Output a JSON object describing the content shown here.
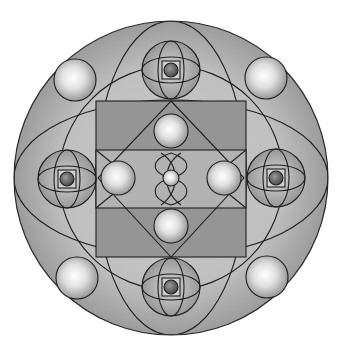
{
  "diagram": {
    "type": "sacred-geometry-mandala",
    "colors": {
      "background": "#ffffff",
      "outer_disc": "#a6a6a6",
      "inner_square": "#8e8e8e",
      "middle_band": "#a8a8a8",
      "line": "#1f1f1f",
      "orb_highlight": "#ffffff",
      "orb_shadow": "#8a8a8a"
    },
    "elements": {
      "outer_circle": {
        "cx": 171,
        "cy": 178,
        "r": 157
      },
      "square": {
        "x": 96,
        "y": 101,
        "w": 150,
        "h": 156
      },
      "diamond": {
        "top": [
          171,
          101
        ],
        "right": [
          244,
          178
        ],
        "bottom": [
          171,
          257
        ],
        "left": [
          98,
          178
        ]
      },
      "eye_orbs": [
        {
          "name": "top",
          "cx": 171,
          "cy": 70,
          "r": 29
        },
        {
          "name": "bottom",
          "cx": 171,
          "cy": 287,
          "r": 29
        },
        {
          "name": "left",
          "cx": 67,
          "cy": 179,
          "r": 29
        },
        {
          "name": "right",
          "cx": 276,
          "cy": 178,
          "r": 29
        }
      ],
      "corner_orbs": [
        {
          "name": "top-left",
          "cx": 75,
          "cy": 80,
          "r": 21
        },
        {
          "name": "top-right",
          "cx": 266,
          "cy": 78,
          "r": 21
        },
        {
          "name": "bottom-left",
          "cx": 77,
          "cy": 278,
          "r": 21
        },
        {
          "name": "bottom-right",
          "cx": 267,
          "cy": 277,
          "r": 21
        }
      ],
      "inner_orbs": [
        {
          "name": "top",
          "cx": 171,
          "cy": 131,
          "r": 17
        },
        {
          "name": "bottom",
          "cx": 171,
          "cy": 226,
          "r": 17
        },
        {
          "name": "left",
          "cx": 118,
          "cy": 178,
          "r": 17
        },
        {
          "name": "right",
          "cx": 224,
          "cy": 178,
          "r": 17
        },
        {
          "name": "center",
          "cx": 171,
          "cy": 178,
          "r": 8
        }
      ]
    }
  }
}
